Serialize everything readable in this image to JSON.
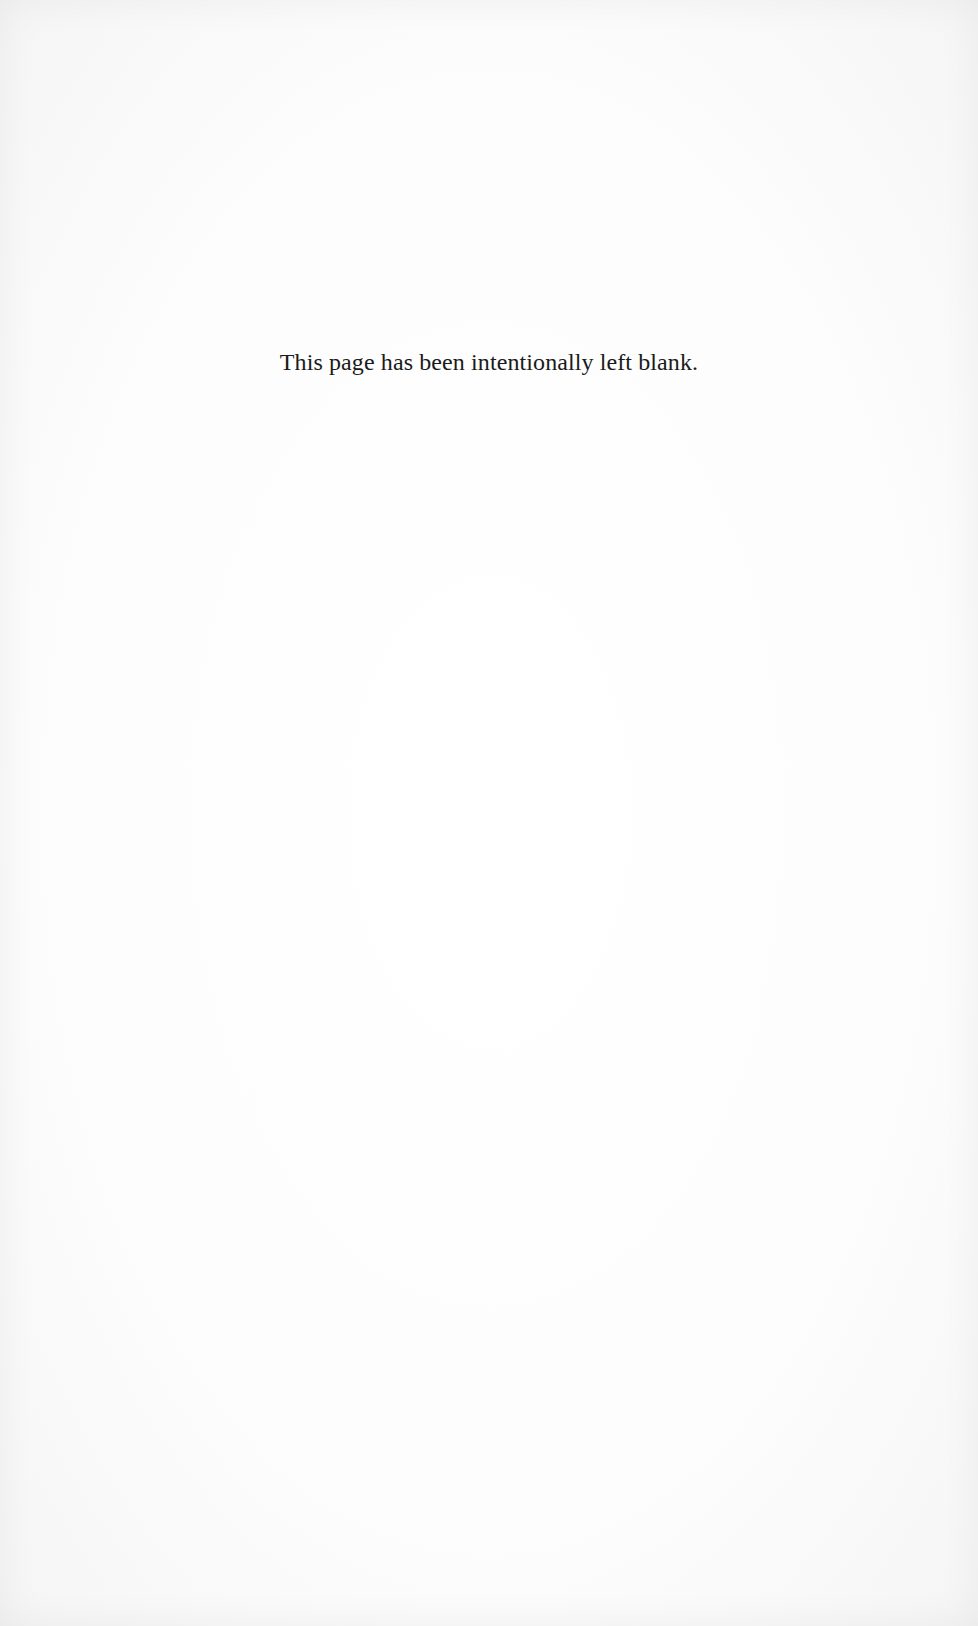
{
  "page": {
    "notice_text": "This page has been intentionally left blank.",
    "background_color": "#ffffff",
    "text_color": "#1a1a1a"
  }
}
